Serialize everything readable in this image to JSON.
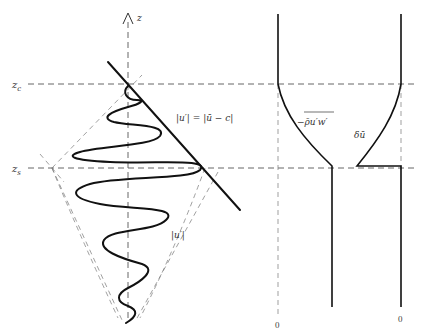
{
  "caption_fragment": "(clipped caption text at top edge)",
  "left_panel": {
    "axis_label": "z",
    "levels": [
      {
        "name": "critical-level",
        "label": "z",
        "subscript": "c"
      },
      {
        "name": "source-level",
        "label": "z",
        "subscript": "s"
      }
    ],
    "annotations": {
      "envelope_equality": "|u′| = |ū − c|",
      "envelope_amplitude": "|u′|"
    }
  },
  "right_panel": {
    "profiles": [
      {
        "name": "momentum-flux",
        "label": "−ρ̄u′w′",
        "zero_label": "0"
      },
      {
        "name": "mean-flow-change",
        "label": "δū",
        "zero_label": "0"
      }
    ]
  },
  "colors": {
    "line": "#111111",
    "dashed": "#555555",
    "background": "#ffffff"
  }
}
